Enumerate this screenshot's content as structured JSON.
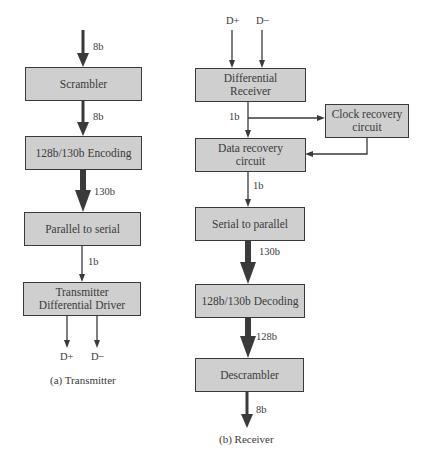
{
  "transmitter": {
    "caption": "(a) Transmitter",
    "input_label": "8b",
    "blocks": [
      {
        "id": "scrambler",
        "label": "Scrambler"
      },
      {
        "id": "encoding",
        "label": "128b/130b Encoding"
      },
      {
        "id": "parallel-to-serial",
        "label": "Parallel to serial"
      },
      {
        "id": "tx-driver",
        "label": "Transmitter Differential Driver"
      }
    ],
    "links": [
      "8b",
      "130b",
      "1b"
    ],
    "outputs": [
      "D+",
      "D−"
    ]
  },
  "receiver": {
    "caption": "(b) Receiver",
    "inputs": [
      "D+",
      "D−"
    ],
    "blocks": [
      {
        "id": "diff-receiver",
        "label": "Differential Receiver"
      },
      {
        "id": "clock-recovery",
        "label": "Clock recovery circuit"
      },
      {
        "id": "data-recovery",
        "label": "Data recovery circuit"
      },
      {
        "id": "serial-to-parallel",
        "label": "Serial to parallel"
      },
      {
        "id": "decoding",
        "label": "128b/130b Decoding"
      },
      {
        "id": "descrambler",
        "label": "Descrambler"
      }
    ],
    "links": [
      "1b",
      "1b",
      "130b",
      "128b"
    ],
    "output_label": "8b"
  },
  "colors": {
    "box_fill": "#cfcfcf",
    "stroke": "#3a3a3a",
    "background": "#ffffff"
  }
}
